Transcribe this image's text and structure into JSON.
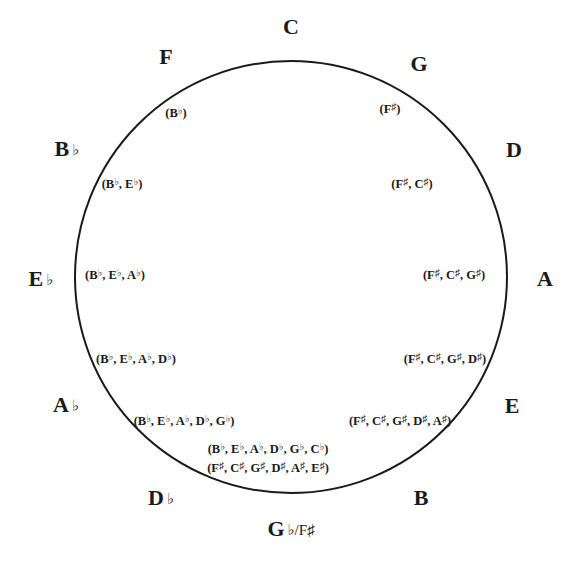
{
  "diagram": {
    "circle": {
      "cx": 291,
      "cy": 277,
      "r": 216,
      "stroke": "#1a1a1a",
      "stroke_width": 2
    },
    "keys": [
      {
        "id": "C",
        "letter": "C",
        "accidental": "",
        "x": 291,
        "y": 27
      },
      {
        "id": "G",
        "letter": "G",
        "accidental": "",
        "x": 419,
        "y": 64
      },
      {
        "id": "D",
        "letter": "D",
        "accidental": "",
        "x": 514,
        "y": 150
      },
      {
        "id": "A",
        "letter": "A",
        "accidental": "",
        "x": 545,
        "y": 279
      },
      {
        "id": "E",
        "letter": "E",
        "accidental": "",
        "x": 512,
        "y": 406
      },
      {
        "id": "B",
        "letter": "B",
        "accidental": "",
        "x": 421,
        "y": 498
      },
      {
        "id": "Gb-F#",
        "letter": "G",
        "accidental": "♭/F♯",
        "x": 291,
        "y": 529
      },
      {
        "id": "Db",
        "letter": "D",
        "accidental": "♭",
        "x": 161,
        "y": 498
      },
      {
        "id": "Ab",
        "letter": "A",
        "accidental": "♭",
        "x": 66,
        "y": 405
      },
      {
        "id": "Eb",
        "letter": "E",
        "accidental": "♭",
        "x": 41,
        "y": 279
      },
      {
        "id": "Bb",
        "letter": "B",
        "accidental": "♭",
        "x": 67,
        "y": 149
      },
      {
        "id": "F",
        "letter": "F",
        "accidental": "",
        "x": 166,
        "y": 57
      }
    ],
    "signatures": [
      {
        "key": "G",
        "x": 390,
        "y": 109,
        "notes": [
          "F♯"
        ]
      },
      {
        "key": "D",
        "x": 412,
        "y": 184,
        "notes": [
          "F♯",
          "C♯"
        ]
      },
      {
        "key": "A",
        "x": 454,
        "y": 275,
        "notes": [
          "F♯",
          "C♯",
          "G♯"
        ]
      },
      {
        "key": "E",
        "x": 445,
        "y": 359,
        "notes": [
          "F♯",
          "C♯",
          "G♯",
          "D♯"
        ]
      },
      {
        "key": "B",
        "x": 400,
        "y": 421,
        "notes": [
          "F♯",
          "C♯",
          "G♯",
          "D♯",
          "A♯"
        ]
      },
      {
        "key": "Gb",
        "x": 268,
        "y": 449,
        "notes": [
          "B♭",
          "E♭",
          "A♭",
          "D♭",
          "G♭",
          "C♭"
        ]
      },
      {
        "key": "F#",
        "x": 268,
        "y": 468,
        "notes": [
          "F♯",
          "C♯",
          "G♯",
          "D♯",
          "A♯",
          "E♯"
        ]
      },
      {
        "key": "Db",
        "x": 184,
        "y": 421,
        "notes": [
          "B♭",
          "E♭",
          "A♭",
          "D♭",
          "G♭"
        ]
      },
      {
        "key": "Ab",
        "x": 136,
        "y": 359,
        "notes": [
          "B♭",
          "E♭",
          "A♭",
          "D♭"
        ]
      },
      {
        "key": "Eb",
        "x": 115,
        "y": 275,
        "notes": [
          "B♭",
          "E♭",
          "A♭"
        ]
      },
      {
        "key": "Bb",
        "x": 122,
        "y": 184,
        "notes": [
          "B♭",
          "E♭"
        ]
      },
      {
        "key": "F",
        "x": 176,
        "y": 113,
        "notes": [
          "B♭"
        ]
      }
    ]
  }
}
